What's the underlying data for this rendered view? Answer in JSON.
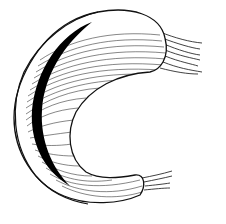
{
  "figure": {
    "shape": "C-shaped crescent",
    "style": "black ink line engraving with hatching",
    "colors": {
      "background": "#ffffff",
      "ink": "#111111",
      "shadow": "#000000"
    }
  }
}
